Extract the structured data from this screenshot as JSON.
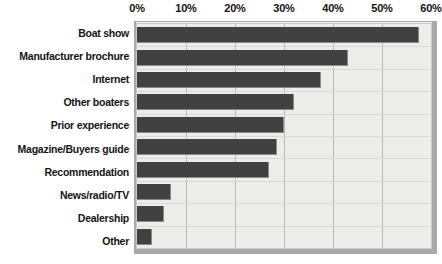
{
  "chart_data": {
    "type": "bar",
    "orientation": "horizontal",
    "title": "",
    "xlabel": "",
    "ylabel": "",
    "xlim": [
      0,
      60
    ],
    "grid": true,
    "legend": false,
    "axis_tick_labels": [
      "0%",
      "10%",
      "20%",
      "30%",
      "40%",
      "50%",
      "60%"
    ],
    "axis_ticks": [
      0,
      10,
      20,
      30,
      40,
      50,
      60
    ],
    "categories": [
      "Boat show",
      "Manufacturer brochure",
      "Internet",
      "Other boaters",
      "Prior experience",
      "Magazine/Buyers guide",
      "Recommendation",
      "News/radio/TV",
      "Dealership",
      "Other"
    ],
    "values": [
      57.5,
      43,
      37.5,
      32,
      30,
      28.5,
      27,
      7,
      5.5,
      3
    ]
  },
  "colors": {
    "bar_fill": "#414141",
    "plot_background": "#ececeb",
    "frame": "#a9a9a9",
    "gridline": "#b9b9b9",
    "text": "#131313"
  }
}
